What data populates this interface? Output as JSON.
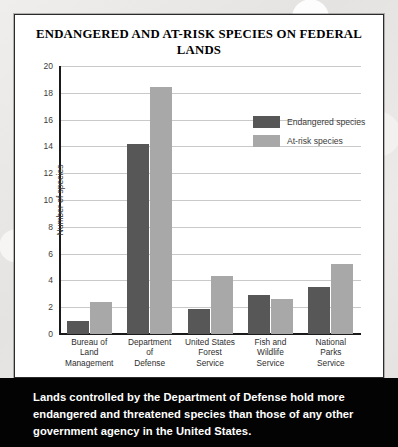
{
  "card": {
    "title": "ENDANGERED AND AT-RISK SPECIES ON FEDERAL LANDS"
  },
  "legend": {
    "items": [
      {
        "label": "Endangered species",
        "color": "#575757",
        "key": "endangered"
      },
      {
        "label": "At-risk species",
        "color": "#a8a8a8",
        "key": "atrisk"
      }
    ]
  },
  "caption": {
    "text": "Lands controlled by the Department of Defense hold more endangered and threatened species than those of any other government agency in the United States."
  },
  "chart_data": {
    "type": "bar",
    "title": "ENDANGERED AND AT-RISK SPECIES ON FEDERAL LANDS",
    "xlabel": "",
    "ylabel": "Number of species",
    "ylim": [
      0,
      20
    ],
    "ytick_interval": 2,
    "yticks": [
      20,
      18,
      16,
      14,
      12,
      10,
      8,
      6,
      4,
      2,
      0
    ],
    "grid": true,
    "legend_position": "inside-top-right",
    "categories": [
      "Bureau of\nLand\nManagement",
      "Department\nof\nDefense",
      "United States\nForest\nService",
      "Fish and\nWildlife\nService",
      "National\nParks\nService"
    ],
    "series": [
      {
        "name": "Endangered species",
        "color": "#575757",
        "values": [
          1.0,
          14.2,
          1.9,
          2.9,
          3.5
        ]
      },
      {
        "name": "At-risk species",
        "color": "#a8a8a8",
        "values": [
          2.4,
          18.4,
          4.3,
          2.6,
          5.2
        ]
      }
    ]
  }
}
